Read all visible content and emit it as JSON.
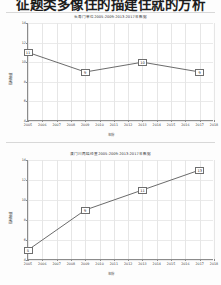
{
  "document": {
    "heading": "征题类多像住的描建住就的方析"
  },
  "charts": [
    {
      "id": "chart1",
      "subtitle": "长寿门单位2005-2009-2013-2017年数据",
      "xlabel": "年份",
      "ylabel": "指标数值",
      "yticks": [
        "4",
        "6",
        "8",
        "10",
        "12",
        "14"
      ],
      "xticks": [
        "2005",
        "2006",
        "2007",
        "2008",
        "2009",
        "2010",
        "2011",
        "2012",
        "2013",
        "2014",
        "2015",
        "2016",
        "2017",
        "2018"
      ],
      "chart_data": {
        "type": "line",
        "title": "长寿门单位2005-2009-2013-2017年数据",
        "xlabel": "年份",
        "ylabel": "指标数值",
        "categories": [
          "2005",
          "2009",
          "2013",
          "2017"
        ],
        "values": [
          11,
          9,
          10,
          9
        ],
        "point_labels": [
          "11",
          "9",
          "10",
          "9"
        ],
        "xlim": [
          2005,
          2018
        ],
        "ylim": [
          4,
          14
        ],
        "grid": true,
        "legend": "none",
        "marker": "boxed-label"
      }
    },
    {
      "id": "chart2",
      "subtitle": "澳门川两结经查2005-2009-2013-2017年数据",
      "xlabel": "年份",
      "ylabel": "指标数值",
      "yticks": [
        "4",
        "6",
        "8",
        "10",
        "12",
        "14"
      ],
      "xticks": [
        "2005",
        "2006",
        "2007",
        "2008",
        "2009",
        "2010",
        "2011",
        "2012",
        "2013",
        "2014",
        "2015",
        "2016",
        "2017",
        "2018"
      ],
      "chart_data": {
        "type": "line",
        "title": "澳门川两结经查2005-2009-2013-2017年数据",
        "xlabel": "年份",
        "ylabel": "指标数值",
        "categories": [
          "2005",
          "2009",
          "2013",
          "2017"
        ],
        "values": [
          5,
          9,
          11,
          13
        ],
        "point_labels": [
          "5",
          "9",
          "11",
          "13"
        ],
        "xlim": [
          2005,
          2018
        ],
        "ylim": [
          4,
          14
        ],
        "grid": true,
        "legend": "none",
        "marker": "boxed-label"
      }
    }
  ],
  "colors": {
    "line": "#5a5a5a",
    "grid": "#e6e6e6",
    "axis": "#8c8c8c",
    "text": "#2b2b2b"
  }
}
